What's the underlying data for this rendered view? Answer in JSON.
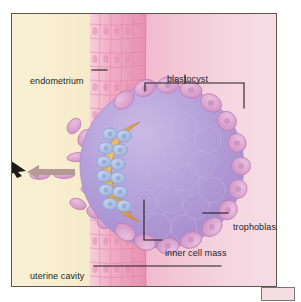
{
  "figure": {
    "panel_background": "#f7edcf",
    "border_color": "#5d5450"
  },
  "labels": {
    "endometrium": "endometrium",
    "blastocyst": "blastocyst",
    "trophoblast": "trophoblast",
    "inner_cell_mass": "inner cell mass",
    "uterine_cavity": "uterine cavity"
  },
  "structures": {
    "endometrium_epithelium": {
      "name": "endometrium",
      "description": "columnar epithelial cell layer",
      "color": "#efa9c0"
    },
    "uterine_cavity": {
      "name": "uterine cavity",
      "color": "#f8efd2"
    },
    "blastocyst": {
      "name": "blastocyst",
      "color": "#b9a4d8"
    },
    "trophoblast": {
      "name": "trophoblast",
      "description": "outer cell layer, invasive projections into endometrium",
      "color": "#d9a2cc"
    },
    "inner_cell_mass": {
      "name": "inner cell mass",
      "colors": [
        "#e5a855",
        "#a9bce0"
      ]
    }
  },
  "annotations": {
    "flow_arrow": {
      "name": "direction-arrow",
      "direction": "left",
      "color": "#b49a93"
    },
    "pointer": {
      "name": "edge-pointer",
      "color": "#1b1a18"
    },
    "blastocyst_bracket": {
      "name": "bracket",
      "color": "#231f1d"
    }
  },
  "colors": {
    "ink": "#231f1d",
    "leader": "#231f1d",
    "cavity": "#f8efd2",
    "stroma": "#f2c3d3",
    "epithelium": "#efa9c0",
    "blastocyst_core": "#b9a4d8",
    "trophoblast": "#d9a2cc",
    "icm_gold": "#e5a855",
    "icm_blue": "#a9bce0",
    "arrow": "#b49a93",
    "chip": "#f5dde4"
  }
}
